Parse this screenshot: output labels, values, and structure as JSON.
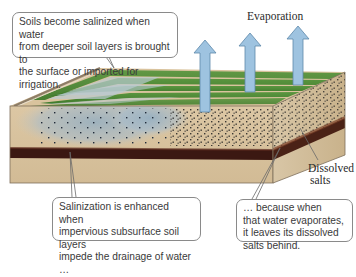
{
  "diagram": {
    "labels": {
      "evaporation": "Evaporation",
      "dissolved_salts_line1": "Dissolved",
      "dissolved_salts_line2": "salts"
    },
    "callouts": {
      "top": {
        "line1": "Soils become salinized when water",
        "line2": "from deeper soil layers is brought to",
        "line3": "the surface or imported for irrigation."
      },
      "bottom_left": {
        "line1": "Salinization is enhanced when",
        "line2": "impervious subsurface soil layers",
        "line3": "impede the drainage of water …"
      },
      "bottom_right": {
        "line1": "… because when",
        "line2": "that water evaporates,",
        "line3": "it leaves its dissolved",
        "line4": "salts behind."
      }
    },
    "colors": {
      "soil_light": "#d9c3a0",
      "soil_side": "#cdb68f",
      "impervious_layer": "#3e1a12",
      "grass": "#4f8a35",
      "water_tint": "#9fb8c8",
      "arrow_fill": "#9ec3e0",
      "arrow_stroke": "#5d88aa",
      "salt_dot": "#1e1e1e"
    },
    "arrows": [
      {
        "x": 205,
        "top": 40,
        "bottom": 112
      },
      {
        "x": 250,
        "top": 34,
        "bottom": 92
      },
      {
        "x": 298,
        "top": 26,
        "bottom": 85
      }
    ]
  }
}
